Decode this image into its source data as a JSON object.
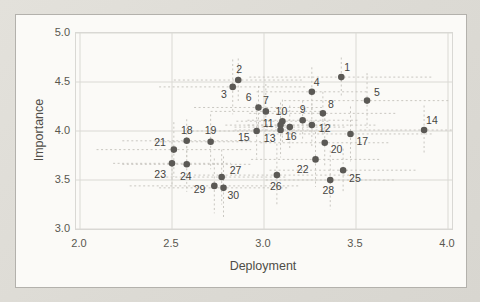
{
  "chart_data": {
    "type": "scatter",
    "title": "",
    "xlabel": "Deployment",
    "ylabel": "Importance",
    "xlim": [
      2.0,
      4.0
    ],
    "ylim": [
      3.0,
      5.0
    ],
    "x_ticks": {
      "values": [
        2.0,
        2.5,
        3.0,
        3.5,
        4.0
      ],
      "labels": [
        "2.0",
        "2.5",
        "3.0",
        "3.5",
        "4.0"
      ]
    },
    "y_ticks": {
      "values": [
        3.0,
        3.5,
        4.0,
        4.5,
        5.0
      ],
      "labels": [
        "3.0",
        "3.5",
        "4.0",
        "4.5",
        "5.0"
      ]
    },
    "grid": true,
    "legend": false,
    "error_bars": true,
    "points": [
      {
        "label": "1",
        "x": 3.42,
        "y": 4.55,
        "ex": 0.5,
        "ey": 0.2,
        "ldx": 3,
        "ldy": -6,
        "anchor": "start"
      },
      {
        "label": "2",
        "x": 2.86,
        "y": 4.52,
        "ex": 0.35,
        "ey": 0.22,
        "ldx": 1,
        "ldy": -7,
        "anchor": "middle"
      },
      {
        "label": "3",
        "x": 2.83,
        "y": 4.45,
        "ex": 0.4,
        "ey": 0.28,
        "ldx": -6,
        "ldy": 11,
        "anchor": "end"
      },
      {
        "label": "4",
        "x": 3.26,
        "y": 4.4,
        "ex": 0.3,
        "ey": 0.25,
        "ldx": 2,
        "ldy": -6,
        "anchor": "start"
      },
      {
        "label": "5",
        "x": 3.56,
        "y": 4.31,
        "ex": 0.45,
        "ey": 0.28,
        "ldx": 7,
        "ldy": -5,
        "anchor": "start"
      },
      {
        "label": "6",
        "x": 2.97,
        "y": 4.24,
        "ex": 0.35,
        "ey": 0.22,
        "ldx": -7,
        "ldy": -6,
        "anchor": "end"
      },
      {
        "label": "7",
        "x": 3.01,
        "y": 4.2,
        "ex": 0.3,
        "ey": 0.28,
        "ldx": 0,
        "ldy": -7,
        "anchor": "middle"
      },
      {
        "label": "8",
        "x": 3.32,
        "y": 4.18,
        "ex": 0.4,
        "ey": 0.22,
        "ldx": 5,
        "ldy": -5,
        "anchor": "start"
      },
      {
        "label": "9",
        "x": 3.21,
        "y": 4.11,
        "ex": 0.3,
        "ey": 0.2,
        "ldx": 0,
        "ldy": -7,
        "anchor": "middle"
      },
      {
        "label": "10",
        "x": 3.1,
        "y": 4.1,
        "ex": 0.25,
        "ey": 0.22,
        "ldx": -1,
        "ldy": -6,
        "anchor": "middle"
      },
      {
        "label": "11",
        "x": 3.09,
        "y": 4.06,
        "ex": 0.3,
        "ey": 0.18,
        "ldx": -7,
        "ldy": 2,
        "anchor": "end"
      },
      {
        "label": "12",
        "x": 3.26,
        "y": 4.06,
        "ex": 0.35,
        "ey": 0.22,
        "ldx": 7,
        "ldy": 7,
        "anchor": "start"
      },
      {
        "label": "13",
        "x": 3.09,
        "y": 4.01,
        "ex": 0.25,
        "ey": 0.28,
        "ldx": -5,
        "ldy": 12,
        "anchor": "end"
      },
      {
        "label": "14",
        "x": 3.87,
        "y": 4.01,
        "ex": 0.35,
        "ey": 0.25,
        "ldx": 2,
        "ldy": -6,
        "anchor": "start"
      },
      {
        "label": "15",
        "x": 2.96,
        "y": 4.0,
        "ex": 0.4,
        "ey": 0.28,
        "ldx": -7,
        "ldy": 10,
        "anchor": "end"
      },
      {
        "label": "16",
        "x": 3.14,
        "y": 4.04,
        "ex": 0.3,
        "ey": 0.22,
        "ldx": 1,
        "ldy": 13,
        "anchor": "middle"
      },
      {
        "label": "17",
        "x": 3.47,
        "y": 3.97,
        "ex": 0.45,
        "ey": 0.28,
        "ldx": 6,
        "ldy": 11,
        "anchor": "start"
      },
      {
        "label": "18",
        "x": 2.58,
        "y": 3.9,
        "ex": 0.35,
        "ey": 0.22,
        "ldx": 0,
        "ldy": -7,
        "anchor": "middle"
      },
      {
        "label": "19",
        "x": 2.71,
        "y": 3.89,
        "ex": 0.3,
        "ey": 0.28,
        "ldx": 0,
        "ldy": -8,
        "anchor": "middle"
      },
      {
        "label": "20",
        "x": 3.33,
        "y": 3.88,
        "ex": 0.35,
        "ey": 0.25,
        "ldx": 6,
        "ldy": 10,
        "anchor": "start"
      },
      {
        "label": "21",
        "x": 2.51,
        "y": 3.81,
        "ex": 0.42,
        "ey": 0.28,
        "ldx": -8,
        "ldy": -4,
        "anchor": "end"
      },
      {
        "label": "22",
        "x": 3.28,
        "y": 3.71,
        "ex": 0.35,
        "ey": 0.28,
        "ldx": -7,
        "ldy": 14,
        "anchor": "end"
      },
      {
        "label": "23",
        "x": 2.5,
        "y": 3.67,
        "ex": 0.32,
        "ey": 0.22,
        "ldx": -6,
        "ldy": 15,
        "anchor": "end"
      },
      {
        "label": "24",
        "x": 2.58,
        "y": 3.66,
        "ex": 0.35,
        "ey": 0.28,
        "ldx": -1,
        "ldy": 16,
        "anchor": "middle"
      },
      {
        "label": "25",
        "x": 3.43,
        "y": 3.6,
        "ex": 0.4,
        "ey": 0.22,
        "ldx": 6,
        "ldy": 12,
        "anchor": "start"
      },
      {
        "label": "26",
        "x": 3.07,
        "y": 3.55,
        "ex": 0.45,
        "ey": 0.32,
        "ldx": -1,
        "ldy": 15,
        "anchor": "middle"
      },
      {
        "label": "27",
        "x": 2.77,
        "y": 3.53,
        "ex": 0.35,
        "ey": 0.28,
        "ldx": 8,
        "ldy": -3,
        "anchor": "start"
      },
      {
        "label": "28",
        "x": 3.36,
        "y": 3.5,
        "ex": 0.35,
        "ey": 0.3,
        "ldx": -2,
        "ldy": 14,
        "anchor": "middle"
      },
      {
        "label": "29",
        "x": 2.73,
        "y": 3.44,
        "ex": 0.46,
        "ey": 0.28,
        "ldx": -9,
        "ldy": 7,
        "anchor": "end"
      },
      {
        "label": "30",
        "x": 2.78,
        "y": 3.42,
        "ex": 0.35,
        "ey": 0.32,
        "ldx": 4,
        "ldy": 11,
        "anchor": "start"
      }
    ]
  },
  "colors": {
    "marker": "#5b5955",
    "error_bar": "#c9c7c1",
    "gridline": "#dad9d4",
    "plot_border": "#d9d8d4",
    "tick_text": "#59574f",
    "point_label_text": "#45443f"
  }
}
